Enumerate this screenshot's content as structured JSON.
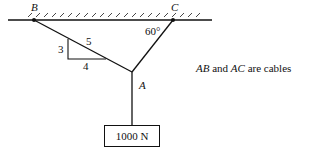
{
  "diagram": {
    "points": {
      "B": {
        "label": "B",
        "x": 34,
        "y": 20
      },
      "C": {
        "label": "C",
        "x": 173,
        "y": 20
      },
      "A": {
        "label": "A",
        "x": 132,
        "y": 72
      }
    },
    "angle_label": "60°",
    "slope_triangle": {
      "rise": "3",
      "run": "4",
      "hypotenuse": "5"
    },
    "load": {
      "label": "1000 N"
    },
    "note": {
      "part1": "AB",
      "and": "and",
      "part2": "AC",
      "suffix": "are cables"
    }
  }
}
